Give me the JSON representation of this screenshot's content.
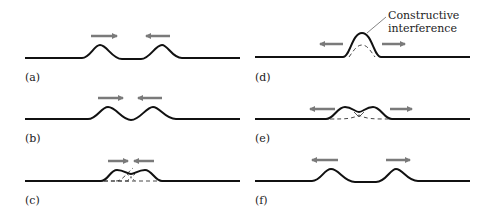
{
  "figure": {
    "panels": [
      {
        "id": "a",
        "label": "(a)",
        "description": "Two pulses approaching each other"
      },
      {
        "id": "b",
        "label": "(b)",
        "description": "Pulses closer together"
      },
      {
        "id": "c",
        "label": "(c)",
        "description": "Pulses beginning to overlap"
      },
      {
        "id": "d",
        "label": "(d)",
        "description": "Pulses fully overlapped",
        "annotation_line1": "Constructive",
        "annotation_line2": "interference"
      },
      {
        "id": "e",
        "label": "(e)",
        "description": "Pulses separating"
      },
      {
        "id": "f",
        "label": "(f)",
        "description": "Pulses moving apart"
      }
    ],
    "colors": {
      "wave": "#111111",
      "arrow": "#7a7a7a",
      "dashed": "#333333"
    }
  }
}
